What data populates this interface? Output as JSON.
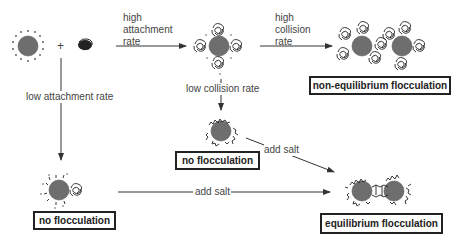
{
  "colors": {
    "particle_fill": "#6e6e6e",
    "particle_stroke": "#555555",
    "polymer": "#222222",
    "arrow": "#333333",
    "box_border": "#222222",
    "text": "#444444"
  },
  "labels": {
    "plus": "+",
    "high_attachment": [
      "high",
      "attachment",
      "rate"
    ],
    "high_collision": [
      "high",
      "collision",
      "rate"
    ],
    "low_attachment": "low attachment rate",
    "low_collision": "low collision rate",
    "add_salt_diag": "add salt",
    "add_salt_horiz": "add salt"
  },
  "boxes": {
    "non_equilibrium": "non-equilibrium flocculation",
    "no_flocculation_mid": "no flocculation",
    "no_flocculation_left": "no flocculation",
    "equilibrium": "equilibrium flocculation"
  },
  "nodes": [
    {
      "id": "bare-particle",
      "desc": "particle with counter-ions"
    },
    {
      "id": "polymer-coil",
      "desc": "free polymer coil"
    },
    {
      "id": "particle-coated-coils",
      "desc": "particle with attached polymer coils"
    },
    {
      "id": "nonequilibrium-floc",
      "desc": "two particles bridged by coils"
    },
    {
      "id": "particle-flat-adsorbed-mid",
      "desc": "particle with flat adsorbed polymer"
    },
    {
      "id": "particle-slow-adsorb-left",
      "desc": "particle with coil slowly adsorbing"
    },
    {
      "id": "equilibrium-floc",
      "desc": "two particles bridged with flat polymer"
    }
  ]
}
